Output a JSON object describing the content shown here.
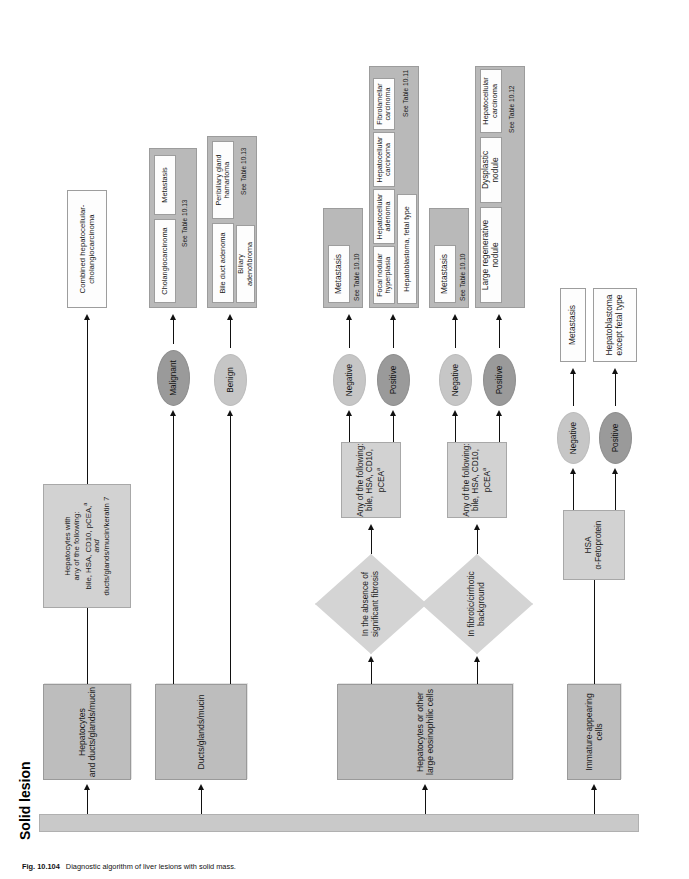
{
  "figure": {
    "number": "Fig. 10.104",
    "caption": "Diagnostic algorithm of liver lesions with solid mass."
  },
  "root": {
    "label": "Solid lesion"
  },
  "branches": [
    {
      "id": "immature",
      "label": "Immature-appearing cells",
      "test": {
        "line1": "HSA",
        "line2": "α-Fetoprotein"
      },
      "results": [
        {
          "oval": "Positive",
          "tone": "dark",
          "outcomes": [
            "Hepatoblastoma\nexcept fetal type"
          ],
          "see_table": ""
        },
        {
          "oval": "Negative",
          "tone": "light",
          "outcomes": [
            "Metastasis"
          ],
          "see_table": ""
        }
      ]
    },
    {
      "id": "hepatocytes-eosinophilic",
      "label": "Hepatocytes or other large eosinophilic cells",
      "conditions": [
        {
          "id": "fibrotic",
          "diamond": "In fibrotic/cirrhotic\nbackground",
          "test": {
            "line1": "Any of the following:",
            "line2": "bile, HSA, CD10, pCEA",
            "sup": "a"
          },
          "results": [
            {
              "oval": "Positive",
              "tone": "dark",
              "outcomes": [
                "Large regenerative nodule",
                "Dysplastic nodule",
                "Hepatocellular carcinoma"
              ],
              "see_table": "See Table 10.12"
            },
            {
              "oval": "Negative",
              "tone": "light",
              "outcomes": [
                "Metastasis"
              ],
              "see_table": "See Table 10.10"
            }
          ]
        },
        {
          "id": "no-fibrosis",
          "diamond": "In the absence of\nsignificant fibrosis",
          "test": {
            "line1": "Any of the following:",
            "line2": "bile, HSA, CD10, pCEA",
            "sup": "a"
          },
          "results": [
            {
              "oval": "Positive",
              "tone": "dark",
              "outcomes": [
                "Focal nodular hyperplasia",
                "Hepatocellular adenoma",
                "Hepatocellular carcinoma",
                "Fibrolamellar carcinoma",
                "Hepatoblastoma, fetal type"
              ],
              "see_table": "See Table 10.11"
            },
            {
              "oval": "Negative",
              "tone": "light",
              "outcomes": [
                "Metastasis"
              ],
              "see_table": "See Table 10.10"
            }
          ]
        }
      ]
    },
    {
      "id": "ducts-glands-mucin",
      "label": "Ducts/glands/mucin",
      "results": [
        {
          "oval": "Benign",
          "tone": "light",
          "outcomes": [
            "Bile duct adenoma",
            "Peribiliary gland\nhamartoma",
            "Biliary\nadenofibroma"
          ],
          "see_table": "See Table 10.13"
        },
        {
          "oval": "Malignant",
          "tone": "dark",
          "outcomes": [
            "Cholangiocarcinoma",
            "Metastasis"
          ],
          "see_table": "See Table 10.13"
        }
      ]
    },
    {
      "id": "hepatocytes-and-ducts",
      "label": "Hepatocytes\nand ducts/glands/mucin",
      "test": {
        "line1": "Hepatocytes with",
        "line2": "any of the following:",
        "line3": "bile, HSA, CD10, pCEA,",
        "sup": "a",
        "line4": "and",
        "line5": "ducts/glands/mucin/keratin 7"
      },
      "results": [
        {
          "oval": "",
          "tone": "",
          "outcomes": [
            "Combined hepatocellular-\ncholangiocarcinoma"
          ],
          "see_table": ""
        }
      ]
    }
  ]
}
